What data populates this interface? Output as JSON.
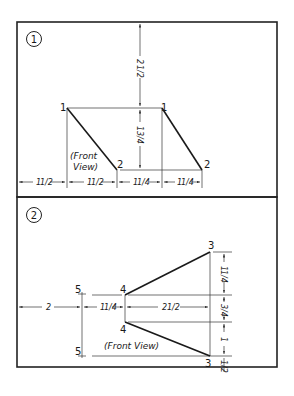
{
  "problems": [
    {
      "number": "1",
      "view_label_line1": "(Front",
      "view_label_line2": "View)",
      "points": [
        {
          "label": "1",
          "role": "left-top"
        },
        {
          "label": "2",
          "role": "left-bottom"
        },
        {
          "label": "1",
          "role": "right-top"
        },
        {
          "label": "2",
          "role": "right-bottom"
        }
      ],
      "dimensions": {
        "vertical_top": "2 1/2",
        "vertical_mid": "1 3/4",
        "horizontal": [
          "1 1/2",
          "1 1/2",
          "1 1/4",
          "1 1/4"
        ]
      }
    },
    {
      "number": "2",
      "view_label": "(Front View)",
      "points": [
        {
          "label": "5",
          "role": "left-top"
        },
        {
          "label": "5",
          "role": "left-bottom"
        },
        {
          "label": "4",
          "role": "mid-top"
        },
        {
          "label": "4",
          "role": "mid-bottom"
        },
        {
          "label": "3",
          "role": "right-top"
        },
        {
          "label": "3",
          "role": "right-bottom"
        }
      ],
      "dimensions": {
        "horizontal": [
          "2",
          "1 1/4",
          "2 1/2"
        ],
        "vertical": [
          "1 1/4",
          "3/4",
          "1",
          "1/2"
        ]
      }
    }
  ],
  "text": {
    "p1_num": "1",
    "p1_pt1a": "1",
    "p1_pt2a": "2",
    "p1_pt1b": "1",
    "p1_pt2b": "2",
    "p1_front": "(Front",
    "p1_view": "View)",
    "p1_d_v1_whole": "2",
    "p1_d_v1_frac": "1/2",
    "p1_d_v2_whole": "1",
    "p1_d_v2_frac": "3/4",
    "p1_d_h1_whole": "1",
    "p1_d_h1_frac": "1/2",
    "p1_d_h2_whole": "1",
    "p1_d_h2_frac": "1/2",
    "p1_d_h3_whole": "1",
    "p1_d_h3_frac": "1/4",
    "p1_d_h4_whole": "1",
    "p1_d_h4_frac": "1/4",
    "p2_num": "2",
    "p2_pt5a": "5",
    "p2_pt5b": "5",
    "p2_pt4a": "4",
    "p2_pt4b": "4",
    "p2_pt3a": "3",
    "p2_pt3b": "3",
    "p2_front_view": "(Front View)",
    "p2_d_h1": "2",
    "p2_d_h2_whole": "1",
    "p2_d_h2_frac": "1/4",
    "p2_d_h3_whole": "2",
    "p2_d_h3_frac": "1/2",
    "p2_d_v1_whole": "1",
    "p2_d_v1_frac": "1/4",
    "p2_d_v2_frac": "3/4",
    "p2_d_v3": "1",
    "p2_d_v4_frac": "1/2"
  }
}
